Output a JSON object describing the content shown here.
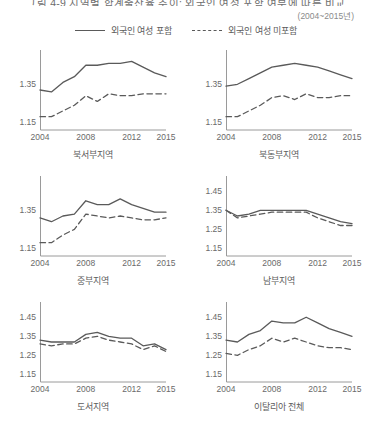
{
  "figure": {
    "title": "그림 4-9  지역별 합계출산율 추이: 외국인 여성 포함 여부에 따른 비교",
    "subtitle": "(2004~2015년)"
  },
  "legend": {
    "items": [
      {
        "label": "외국인 여성 포함",
        "style": "solid"
      },
      {
        "label": "외국인 여성 미포함",
        "style": "dashed"
      }
    ]
  },
  "chart_data": [
    {
      "type": "line",
      "title": "북서부지역",
      "xlabel": "",
      "ylabel": "",
      "x": [
        2004,
        2005,
        2006,
        2007,
        2008,
        2009,
        2010,
        2011,
        2012,
        2013,
        2014,
        2015
      ],
      "xticks": [
        2004,
        2008,
        2012,
        2015
      ],
      "yticks": [
        1.15,
        1.35
      ],
      "ylim": [
        1.11,
        1.53
      ],
      "grid": false,
      "legend_position": "top-center-shared",
      "series": [
        {
          "name": "외국인 여성 포함",
          "style": "solid",
          "values": [
            1.32,
            1.31,
            1.36,
            1.39,
            1.45,
            1.45,
            1.46,
            1.46,
            1.47,
            1.44,
            1.41,
            1.39
          ]
        },
        {
          "name": "외국인 여성 미포함",
          "style": "dashed",
          "values": [
            1.18,
            1.18,
            1.21,
            1.24,
            1.29,
            1.26,
            1.3,
            1.29,
            1.29,
            1.3,
            1.3,
            1.3
          ]
        }
      ]
    },
    {
      "type": "line",
      "title": "북동부지역",
      "xlabel": "",
      "ylabel": "",
      "x": [
        2004,
        2005,
        2006,
        2007,
        2008,
        2009,
        2010,
        2011,
        2012,
        2013,
        2014,
        2015
      ],
      "xticks": [
        2004,
        2008,
        2012,
        2015
      ],
      "yticks": [
        1.15,
        1.35
      ],
      "ylim": [
        1.11,
        1.53
      ],
      "grid": false,
      "legend_position": "top-center-shared",
      "series": [
        {
          "name": "외국인 여성 포함",
          "style": "solid",
          "values": [
            1.34,
            1.35,
            1.38,
            1.41,
            1.44,
            1.45,
            1.46,
            1.45,
            1.44,
            1.42,
            1.4,
            1.38
          ]
        },
        {
          "name": "외국인 여성 미포함",
          "style": "dashed",
          "values": [
            1.18,
            1.18,
            1.21,
            1.24,
            1.28,
            1.29,
            1.27,
            1.3,
            1.28,
            1.28,
            1.29,
            1.29
          ]
        }
      ]
    },
    {
      "type": "line",
      "title": "중부지역",
      "xlabel": "",
      "ylabel": "",
      "x": [
        2004,
        2005,
        2006,
        2007,
        2008,
        2009,
        2010,
        2011,
        2012,
        2013,
        2014,
        2015
      ],
      "xticks": [
        2004,
        2008,
        2012,
        2015
      ],
      "yticks": [
        1.15,
        1.35
      ],
      "ylim": [
        1.11,
        1.53
      ],
      "grid": false,
      "legend_position": "top-center-shared",
      "series": [
        {
          "name": "외국인 여성 포함",
          "style": "solid",
          "values": [
            1.31,
            1.29,
            1.32,
            1.33,
            1.4,
            1.38,
            1.38,
            1.41,
            1.38,
            1.36,
            1.34,
            1.34
          ]
        },
        {
          "name": "외국인 여성 미포함",
          "style": "dashed",
          "values": [
            1.18,
            1.18,
            1.22,
            1.25,
            1.33,
            1.32,
            1.31,
            1.32,
            1.31,
            1.3,
            1.3,
            1.31
          ]
        }
      ]
    },
    {
      "type": "line",
      "title": "남부지역",
      "xlabel": "",
      "ylabel": "",
      "x": [
        2004,
        2005,
        2006,
        2007,
        2008,
        2009,
        2010,
        2011,
        2012,
        2013,
        2014,
        2015
      ],
      "xticks": [
        2004,
        2008,
        2012,
        2015
      ],
      "yticks": [
        1.15,
        1.25,
        1.35,
        1.45
      ],
      "ylim": [
        1.11,
        1.53
      ],
      "grid": false,
      "legend_position": "top-center-shared",
      "series": [
        {
          "name": "외국인 여성 포함",
          "style": "solid",
          "values": [
            1.35,
            1.32,
            1.33,
            1.35,
            1.35,
            1.35,
            1.35,
            1.35,
            1.33,
            1.31,
            1.29,
            1.28
          ]
        },
        {
          "name": "외국인 여성 미포함",
          "style": "dashed",
          "values": [
            1.35,
            1.31,
            1.32,
            1.33,
            1.34,
            1.34,
            1.34,
            1.34,
            1.31,
            1.29,
            1.27,
            1.27
          ]
        }
      ]
    },
    {
      "type": "line",
      "title": "도서지역",
      "xlabel": "",
      "ylabel": "",
      "x": [
        2004,
        2005,
        2006,
        2007,
        2008,
        2009,
        2010,
        2011,
        2012,
        2013,
        2014,
        2015
      ],
      "xticks": [
        2004,
        2008,
        2012,
        2015
      ],
      "yticks": [
        1.15,
        1.25,
        1.35,
        1.45
      ],
      "ylim": [
        1.11,
        1.53
      ],
      "grid": false,
      "legend_position": "top-center-shared",
      "series": [
        {
          "name": "외국인 여성 포함",
          "style": "solid",
          "values": [
            1.33,
            1.32,
            1.32,
            1.32,
            1.36,
            1.37,
            1.35,
            1.34,
            1.34,
            1.3,
            1.31,
            1.28
          ]
        },
        {
          "name": "외국인 여성 미포함",
          "style": "dashed",
          "values": [
            1.31,
            1.3,
            1.31,
            1.31,
            1.34,
            1.35,
            1.33,
            1.32,
            1.31,
            1.28,
            1.3,
            1.27
          ]
        }
      ]
    },
    {
      "type": "line",
      "title": "이탈리아 전체",
      "xlabel": "",
      "ylabel": "",
      "x": [
        2004,
        2005,
        2006,
        2007,
        2008,
        2009,
        2010,
        2011,
        2012,
        2013,
        2014,
        2015
      ],
      "xticks": [
        2004,
        2008,
        2012,
        2015
      ],
      "yticks": [
        1.15,
        1.25,
        1.35,
        1.45
      ],
      "ylim": [
        1.11,
        1.53
      ],
      "grid": false,
      "legend_position": "top-center-shared",
      "series": [
        {
          "name": "외국인 여성 포함",
          "style": "solid",
          "values": [
            1.33,
            1.32,
            1.36,
            1.38,
            1.43,
            1.42,
            1.42,
            1.45,
            1.42,
            1.39,
            1.37,
            1.35
          ]
        },
        {
          "name": "외국인 여성 미포함",
          "style": "dashed",
          "values": [
            1.26,
            1.25,
            1.28,
            1.3,
            1.34,
            1.32,
            1.34,
            1.32,
            1.3,
            1.29,
            1.29,
            1.28
          ]
        }
      ]
    }
  ]
}
